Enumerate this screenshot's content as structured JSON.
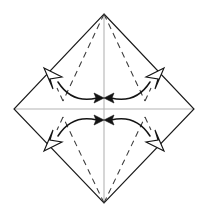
{
  "figure": {
    "title": "Origami fold step diagram",
    "canvas": {
      "width": 209,
      "height": 217
    },
    "background_color": "#ffffff"
  },
  "colors": {
    "outline": "#1a1a1a",
    "axis": "#b4b4b4",
    "crease": "#3a3a3a",
    "arrow": "#141414",
    "arrowhead_fill": "#ffffff"
  },
  "geometry": {
    "vertices": {
      "top": {
        "label": "top-vertex",
        "x": 104,
        "y": 14
      },
      "right": {
        "label": "right-vertex",
        "x": 194,
        "y": 109
      },
      "bottom": {
        "label": "bottom-vertex",
        "x": 104,
        "y": 203
      },
      "left": {
        "label": "left-vertex",
        "x": 14,
        "y": 109
      }
    },
    "center": {
      "label": "center-point",
      "x": 104,
      "y": 109
    },
    "edge_midpoints": {
      "upper_left": {
        "label": "upper-left-midpoint",
        "x": 51,
        "y": 73
      },
      "upper_right": {
        "label": "upper-right-midpoint",
        "x": 158,
        "y": 73
      },
      "lower_left": {
        "label": "lower-left-midpoint",
        "x": 51,
        "y": 146
      },
      "lower_right": {
        "label": "lower-right-midpoint",
        "x": 158,
        "y": 146
      }
    },
    "arrow_targets": {
      "upper": {
        "label": "upper-convergence-point",
        "x": 104,
        "y": 98
      },
      "lower": {
        "label": "lower-convergence-point",
        "x": 104,
        "y": 120
      }
    }
  },
  "paths": {
    "outline": "M 104 14 L 194 109 L 104 203 L 14 109 Z",
    "axis_horizontal": "M 14 109 L 194 109",
    "axis_vertical": "M 104 14 L 104 203",
    "creases": [
      {
        "name": "crease-top-to-upper-left",
        "d": "M 104 14 L 63 101"
      },
      {
        "name": "crease-top-to-upper-right",
        "d": "M 104 14 L 145 101"
      },
      {
        "name": "crease-bottom-to-lower-left",
        "d": "M 104 203 L 63 117"
      },
      {
        "name": "crease-bottom-to-lower-right",
        "d": "M 104 203 L 145 117"
      },
      {
        "name": "crease-top-left-short",
        "d": "M 63 101 L 57 88"
      },
      {
        "name": "crease-top-right-short",
        "d": "M 145 101 L 151 88"
      },
      {
        "name": "crease-bottom-left-short",
        "d": "M 63 117 L 57 130"
      },
      {
        "name": "crease-bottom-right-short",
        "d": "M 145 117 L 151 130"
      }
    ],
    "arcs": [
      {
        "name": "arc-upper-left-to-center",
        "d": "M 58 82 Q 72 104 97 98"
      },
      {
        "name": "arc-upper-right-to-center",
        "d": "M 150 82 Q 136 104 111 98"
      },
      {
        "name": "arc-lower-left-to-center",
        "d": "M 58 136 Q 72 114 97 120"
      },
      {
        "name": "arc-lower-right-to-center",
        "d": "M 150 136 Q 136 114 111 120"
      }
    ],
    "solid_arrowheads": [
      {
        "name": "arrowhead-upper-left-tip",
        "points": "104,98 94,93 96,98 94,103"
      },
      {
        "name": "arrowhead-upper-right-tip",
        "points": "104,98 114,93 112,98 114,103"
      },
      {
        "name": "arrowhead-lower-left-tip",
        "points": "104,120 94,115 96,120 94,125"
      },
      {
        "name": "arrowhead-lower-right-tip",
        "points": "104,120 114,115 112,120 114,125"
      }
    ],
    "open_arrowheads": [
      {
        "name": "open-arrowhead-upper-left",
        "points": "44,68 62,77 50,79 53,89"
      },
      {
        "name": "open-arrowhead-upper-right",
        "points": "164,68 146,77 158,79 155,89"
      },
      {
        "name": "open-arrowhead-lower-left",
        "points": "44,151 62,142 50,140 53,130"
      },
      {
        "name": "open-arrowhead-lower-right",
        "points": "164,151 146,142 158,140 155,130"
      }
    ]
  },
  "legend": {
    "crease_meaning": "valley fold (dashed)",
    "arrow_meaning": "fold corner toward center"
  }
}
